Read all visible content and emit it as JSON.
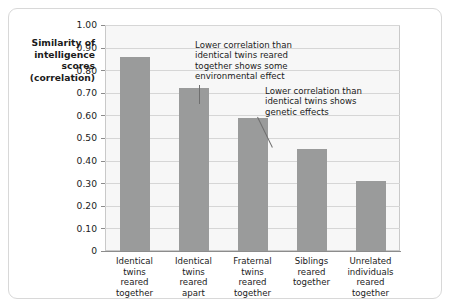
{
  "chart_data": {
    "type": "bar",
    "title": "",
    "xlabel": "",
    "ylabel": "Similarity of intelligence scores (correlation)",
    "ylabel_lines": [
      "Similarity of",
      "intelligence",
      "scores",
      "(correlation)"
    ],
    "categories": [
      "Identical twins reared together",
      "Identical twins reared apart",
      "Fraternal twins reared together",
      "Siblings reared together",
      "Unrelated individuals reared together"
    ],
    "category_lines": [
      [
        "Identical",
        "twins",
        "reared",
        "together"
      ],
      [
        "Identical",
        "twins",
        "reared",
        "apart"
      ],
      [
        "Fraternal",
        "twins",
        "reared",
        "together"
      ],
      [
        "Siblings",
        "reared",
        "together"
      ],
      [
        "Unrelated",
        "individuals",
        "reared",
        "together"
      ]
    ],
    "values": [
      0.86,
      0.72,
      0.59,
      0.45,
      0.31
    ],
    "ylim": [
      0,
      1.0
    ],
    "ytick_values": [
      1.0,
      0.9,
      0.8,
      0.7,
      0.6,
      0.5,
      0.4,
      0.3,
      0.2,
      0.1,
      0
    ],
    "ytick_labels": [
      "1.00",
      "0.90",
      "0.80",
      "0.70",
      "0.60",
      "0.50",
      "0.40",
      "0.30",
      "0.20",
      "0.10",
      "0"
    ],
    "grid": true,
    "legend": "none",
    "bar_color": "#9a9b9b",
    "plot_background": "#f7f7f7",
    "annotations": [
      {
        "text": "Lower correlation than identical twins reared together shows some environmental effect",
        "lines": [
          "Lower correlation than",
          "identical twins reared",
          "together shows some",
          "environmental effect"
        ],
        "points_to_category_index": 1
      },
      {
        "text": "Lower correlation than identical twins shows genetic effects",
        "lines": [
          "Lower correlation than",
          "identical twins shows",
          "genetic effects"
        ],
        "points_to_category_index": 2
      }
    ]
  }
}
